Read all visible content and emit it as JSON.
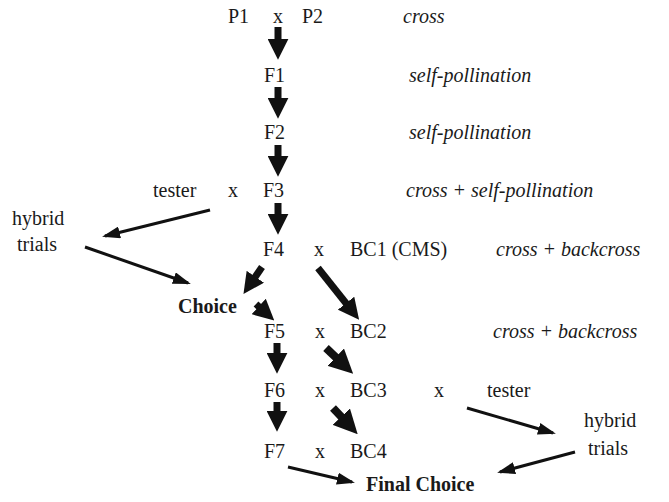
{
  "diagram": {
    "nodes": {
      "p1": "P1",
      "x_p": "x",
      "p2": "P2",
      "f1": "F1",
      "f2": "F2",
      "tester_top": "tester",
      "x_f3": "x",
      "f3": "F3",
      "hybrid_left_1": "hybrid",
      "hybrid_left_2": "trials",
      "f4": "F4",
      "x_f4": "x",
      "bc1": "BC1 (CMS)",
      "choice": "Choice",
      "f5": "F5",
      "x_f5": "x",
      "bc2": "BC2",
      "f6": "F6",
      "x_f6": "x",
      "bc3": "BC3",
      "x_bc3": "x",
      "tester_bottom": "tester",
      "hybrid_right_1": "hybrid",
      "hybrid_right_2": "trials",
      "f7": "F7",
      "x_f7": "x",
      "bc4": "BC4",
      "final_choice": "Final Choice"
    },
    "annotations": {
      "row_p": "cross",
      "row_f1": "self-pollination",
      "row_f2": "self-pollination",
      "row_f3": "cross + self-pollination",
      "row_f4": "cross + backcross",
      "row_f5": "cross + backcross"
    },
    "edges": [
      {
        "from": "P1 x P2",
        "to": "F1"
      },
      {
        "from": "F1",
        "to": "F2"
      },
      {
        "from": "F2",
        "to": "F3"
      },
      {
        "from": "F3",
        "to": "F4"
      },
      {
        "from": "tester x F3",
        "to": "hybrid trials (left)"
      },
      {
        "from": "hybrid trials (left)",
        "to": "Choice"
      },
      {
        "from": "F4",
        "to": "Choice"
      },
      {
        "from": "Choice",
        "to": "F5"
      },
      {
        "from": "F4 x BC1",
        "to": "BC2"
      },
      {
        "from": "F5",
        "to": "F6"
      },
      {
        "from": "F5 x BC2",
        "to": "BC3"
      },
      {
        "from": "F6",
        "to": "F7"
      },
      {
        "from": "F6 x BC3",
        "to": "BC4"
      },
      {
        "from": "BC3 x tester",
        "to": "hybrid trials (right)"
      },
      {
        "from": "hybrid trials (right)",
        "to": "Final Choice"
      },
      {
        "from": "F7",
        "to": "Final Choice"
      }
    ]
  }
}
